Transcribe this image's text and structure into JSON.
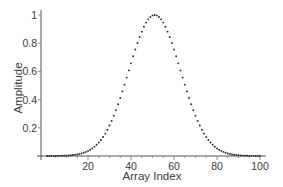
{
  "chart_data": {
    "type": "scatter",
    "title": "",
    "xlabel": "Array Index",
    "ylabel": "Amplitude",
    "xlim": [
      0,
      103
    ],
    "ylim": [
      0,
      1
    ],
    "xticks": [
      20,
      40,
      60,
      80,
      100
    ],
    "xtick_labels": [
      "20",
      "40",
      "60",
      "80",
      "100"
    ],
    "yticks": [
      0.2,
      0.4,
      0.6,
      0.8,
      1
    ],
    "ytick_labels": [
      "0.2",
      "0.4",
      "0.6",
      "0.8",
      "1"
    ],
    "grid": false,
    "legend": null,
    "marker_color": "#2a2a2a",
    "series": [
      {
        "name": "Gaussian",
        "x": [
          1,
          2,
          3,
          4,
          5,
          6,
          7,
          8,
          9,
          10,
          11,
          12,
          13,
          14,
          15,
          16,
          17,
          18,
          19,
          20,
          21,
          22,
          23,
          24,
          25,
          26,
          27,
          28,
          29,
          30,
          31,
          32,
          33,
          34,
          35,
          36,
          37,
          38,
          39,
          40,
          41,
          42,
          43,
          44,
          45,
          46,
          47,
          48,
          49,
          50,
          51,
          52,
          53,
          54,
          55,
          56,
          57,
          58,
          59,
          60,
          61,
          62,
          63,
          64,
          65,
          66,
          67,
          68,
          69,
          70,
          71,
          72,
          73,
          74,
          75,
          76,
          77,
          78,
          79,
          80,
          81,
          82,
          83,
          84,
          85,
          86,
          87,
          88,
          89,
          90,
          91,
          92,
          93,
          94,
          95,
          96,
          97,
          98,
          99,
          100
        ],
        "values": [
          0.0,
          0.0,
          0.0,
          0.0,
          0.001,
          0.001,
          0.001,
          0.002,
          0.002,
          0.003,
          0.004,
          0.005,
          0.007,
          0.009,
          0.011,
          0.014,
          0.018,
          0.023,
          0.029,
          0.036,
          0.044,
          0.054,
          0.066,
          0.08,
          0.096,
          0.114,
          0.135,
          0.159,
          0.186,
          0.216,
          0.249,
          0.286,
          0.325,
          0.367,
          0.411,
          0.458,
          0.506,
          0.556,
          0.607,
          0.657,
          0.707,
          0.755,
          0.801,
          0.844,
          0.882,
          0.917,
          0.946,
          0.969,
          0.986,
          0.997,
          1.0,
          0.997,
          0.986,
          0.969,
          0.946,
          0.917,
          0.882,
          0.844,
          0.801,
          0.755,
          0.707,
          0.657,
          0.607,
          0.556,
          0.506,
          0.458,
          0.411,
          0.367,
          0.325,
          0.286,
          0.249,
          0.216,
          0.186,
          0.159,
          0.135,
          0.114,
          0.096,
          0.08,
          0.066,
          0.054,
          0.044,
          0.036,
          0.029,
          0.023,
          0.018,
          0.014,
          0.011,
          0.009,
          0.007,
          0.005,
          0.004,
          0.003,
          0.002,
          0.002,
          0.001,
          0.001,
          0.001,
          0.0,
          0.0,
          0.0
        ]
      }
    ]
  }
}
